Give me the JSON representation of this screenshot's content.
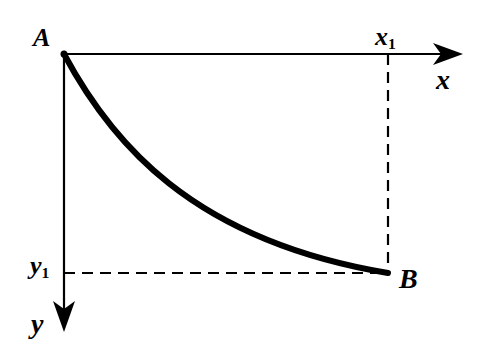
{
  "diagram": {
    "type": "curve-on-axes",
    "colors": {
      "stroke": "#000000",
      "background": "#ffffff"
    },
    "labels": {
      "point_a": "A",
      "point_b": "B",
      "axis_x": "x",
      "axis_y": "y",
      "x1_main": "x",
      "x1_sub": "1",
      "y1_main": "y",
      "y1_sub": "1"
    },
    "geometry": {
      "origin": [
        64,
        54
      ],
      "point_b": [
        388,
        273
      ],
      "x_axis_end": [
        462,
        54
      ],
      "y_axis_end": [
        64,
        330
      ]
    }
  }
}
